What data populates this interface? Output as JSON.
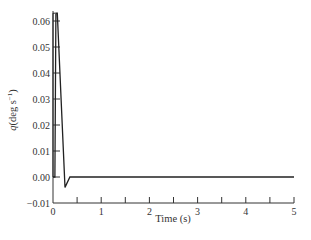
{
  "chart_data": {
    "type": "line",
    "title": "",
    "xlabel": "Time (s)",
    "ylabel": "q(deg s⁻¹)",
    "ylabel_parts": {
      "var": "q",
      "rest": "(deg s",
      "sup": "−1",
      "close": ")"
    },
    "xlim": [
      0,
      5
    ],
    "ylim": [
      -0.01,
      0.06
    ],
    "grid": false,
    "legend": null,
    "x_ticks": [
      0,
      1,
      2,
      3,
      4,
      5
    ],
    "x_tick_labels": [
      "0",
      "1",
      "2",
      "3",
      "4",
      "5"
    ],
    "x_minor_ticks": [
      0.5,
      1.5,
      2.5,
      3.5,
      4.5
    ],
    "y_ticks": [
      -0.01,
      0.0,
      0.01,
      0.02,
      0.03,
      0.04,
      0.05,
      0.06
    ],
    "y_tick_labels": [
      "−0.01",
      "0.00",
      "0.01",
      "0.02",
      "0.03",
      "0.04",
      "0.05",
      "0.06"
    ],
    "series": [
      {
        "name": "q",
        "color": "#222222",
        "x": [
          0.0,
          0.04,
          0.06,
          0.09,
          0.25,
          0.35,
          5.0
        ],
        "y": [
          0.0,
          0.0,
          0.063,
          0.063,
          -0.004,
          0.0,
          0.0
        ]
      }
    ]
  }
}
